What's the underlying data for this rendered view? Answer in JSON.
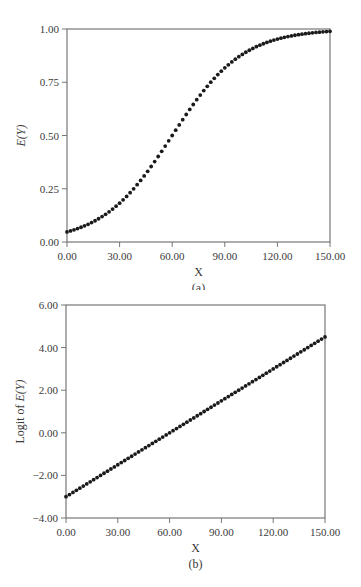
{
  "chart_data": [
    {
      "id": "a",
      "type": "scatter",
      "title": "",
      "caption": "(a)",
      "xlabel": "X",
      "ylabel": "E(Y)",
      "xlim": [
        0,
        150
      ],
      "ylim": [
        0,
        1
      ],
      "xticks": [
        "0.00",
        "30.00",
        "60.00",
        "90.00",
        "120.00",
        "150.00"
      ],
      "yticks": [
        "0.00",
        "0.25",
        "0.50",
        "0.75",
        "1.00"
      ],
      "xtick_values": [
        0,
        30,
        60,
        90,
        120,
        150
      ],
      "ytick_values": [
        0,
        0.25,
        0.5,
        0.75,
        1.0
      ],
      "grid": false,
      "legend": null,
      "series": [
        {
          "name": "E(Y) = 1/(1+exp(-(-3 + 0.05X)))",
          "x_start": 0,
          "x_end": 150,
          "x_step": 2,
          "sample_points": [
            {
              "x": 0,
              "y": 0.047
            },
            {
              "x": 30,
              "y": 0.182
            },
            {
              "x": 60,
              "y": 0.5
            },
            {
              "x": 90,
              "y": 0.818
            },
            {
              "x": 120,
              "y": 0.953
            },
            {
              "x": 150,
              "y": 0.989
            }
          ]
        }
      ]
    },
    {
      "id": "b",
      "type": "scatter",
      "title": "",
      "caption": "(b)",
      "xlabel": "X",
      "ylabel": "Logit of E(Y)",
      "xlim": [
        0,
        150
      ],
      "ylim": [
        -4,
        6
      ],
      "xticks": [
        "0.00",
        "30.00",
        "60.00",
        "90.00",
        "120.00",
        "150.00"
      ],
      "yticks": [
        "-4.00",
        "-2.00",
        "0.00",
        "2.00",
        "4.00",
        "6.00"
      ],
      "xtick_values": [
        0,
        30,
        60,
        90,
        120,
        150
      ],
      "ytick_values": [
        -4,
        -2,
        0,
        2,
        4,
        6
      ],
      "grid": false,
      "legend": null,
      "series": [
        {
          "name": "logit E(Y) = -3 + 0.05X",
          "x_start": 0,
          "x_end": 150,
          "x_step": 2,
          "intercept": -3,
          "slope": 0.05,
          "sample_points": [
            {
              "x": 0,
              "y": -3.0
            },
            {
              "x": 30,
              "y": -1.5
            },
            {
              "x": 60,
              "y": 0.0
            },
            {
              "x": 90,
              "y": 1.5
            },
            {
              "x": 120,
              "y": 3.0
            },
            {
              "x": 150,
              "y": 4.5
            }
          ]
        }
      ]
    }
  ],
  "colors": {
    "axis": "#777777",
    "point": "#1a1a1a",
    "text": "#3a3a3a"
  }
}
